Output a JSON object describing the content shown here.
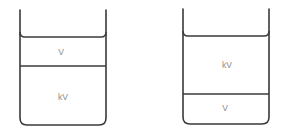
{
  "diagram": {
    "type": "two beakers with immiscible liquid layers",
    "stroke_color": "#3a3a3a",
    "label_color": "#8a8a8a",
    "beakers": [
      {
        "id": "left",
        "layers": [
          {
            "position": "top",
            "label": "V"
          },
          {
            "position": "bottom",
            "label": "kV"
          }
        ]
      },
      {
        "id": "right",
        "layers": [
          {
            "position": "top",
            "label": "kV"
          },
          {
            "position": "bottom",
            "label": "V"
          }
        ]
      }
    ]
  }
}
